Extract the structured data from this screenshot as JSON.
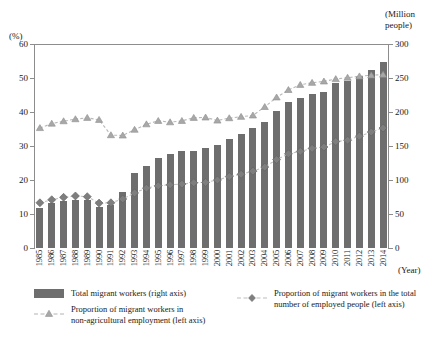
{
  "chart_data": {
    "type": "bar",
    "title": "",
    "xlabel": "(Year)",
    "ylabel": "(%)",
    "y2label": "(Million people)",
    "ylim": [
      0,
      60
    ],
    "y2lim": [
      0,
      300
    ],
    "yticks": [
      0,
      10,
      20,
      30,
      40,
      50,
      60
    ],
    "y2ticks": [
      0,
      50,
      100,
      150,
      200,
      250,
      300
    ],
    "grid": false,
    "legend_position": "bottom",
    "categories": [
      "1985",
      "1986",
      "1987",
      "1988",
      "1989",
      "1990",
      "1991",
      "1992",
      "1993",
      "1994",
      "1995",
      "1996",
      "1997",
      "1998",
      "1999",
      "2000",
      "2001",
      "2002",
      "2003",
      "2004",
      "2005",
      "2006",
      "2007",
      "2008",
      "2009",
      "2010",
      "2011",
      "2012",
      "2013",
      "2014"
    ],
    "series": [
      {
        "name": "Total migrant workers (right axis)",
        "type": "bar",
        "axis": "right",
        "unit": "Million people",
        "color": "#6e6e6e",
        "values": [
          59,
          66,
          69,
          70,
          70,
          60,
          63,
          83,
          110,
          120,
          133,
          138,
          142,
          143,
          147,
          151,
          160,
          168,
          176,
          185,
          201,
          215,
          220,
          226,
          230,
          242,
          245,
          253,
          262,
          274
        ]
      },
      {
        "name": "Proportion of migrant workers in non-agricultural employment (left axis)",
        "type": "line",
        "axis": "left",
        "unit": "%",
        "color": "#a8a8a8",
        "marker": "triangle",
        "values": [
          35.3,
          36.6,
          37.3,
          37.9,
          38.3,
          37.7,
          33.2,
          33.1,
          34.8,
          36.4,
          37.4,
          37.0,
          37.4,
          38.3,
          38.4,
          37.5,
          38.2,
          38.6,
          39.0,
          41.5,
          44.3,
          46.5,
          48.0,
          48.6,
          49.0,
          49.7,
          50.1,
          50.5,
          50.8,
          51.0
        ]
      },
      {
        "name": "Proportion of migrant workers in the total number of employed people (left axis)",
        "type": "line",
        "axis": "left",
        "unit": "%",
        "color": "#7e7e7e",
        "marker": "diamond",
        "values": [
          13.3,
          14.2,
          14.9,
          15.3,
          15.1,
          13.2,
          13.3,
          14.4,
          16.2,
          17.6,
          18.3,
          18.6,
          18.8,
          19.2,
          19.3,
          20.0,
          21.0,
          21.7,
          22.6,
          23.8,
          26.0,
          27.7,
          28.4,
          29.3,
          29.7,
          31.3,
          31.7,
          32.9,
          34.1,
          35.3
        ]
      }
    ],
    "legend": [
      "Total migrant workers (right axis)",
      "Proportion of migrant workers in non-agricultural employment (left axis)",
      "Proportion of migrant workers in the total number of employed people (left axis)"
    ],
    "legend_lines": {
      "bar": [
        "Total migrant workers (right axis)"
      ],
      "nonag": [
        "Proportion of migrant workers in",
        "non-agricultural employment (left axis)"
      ],
      "employed": [
        "Proportion of migrant workers in the total",
        "number of employed people (left axis)"
      ]
    }
  },
  "axes": {
    "left_unit": "(%)",
    "right_unit_line1": "(Million",
    "right_unit_line2": "people)",
    "x_caption": "(Year)",
    "right_zero": "0"
  }
}
